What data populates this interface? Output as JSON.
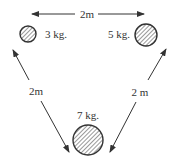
{
  "diagram": {
    "masses": [
      {
        "id": "mass-3",
        "label": "3 kg.",
        "cx": 28,
        "cy": 34,
        "r": 8
      },
      {
        "id": "mass-5",
        "label": "5 kg.",
        "cx": 146,
        "cy": 35,
        "r": 11
      },
      {
        "id": "mass-7",
        "label": "7 kg.",
        "cx": 88,
        "cy": 140,
        "r": 15
      }
    ],
    "distances": {
      "top": "2m",
      "left": "2m",
      "right": "2 m"
    },
    "colors": {
      "stroke": "#333333",
      "hatch": "#444444"
    }
  }
}
